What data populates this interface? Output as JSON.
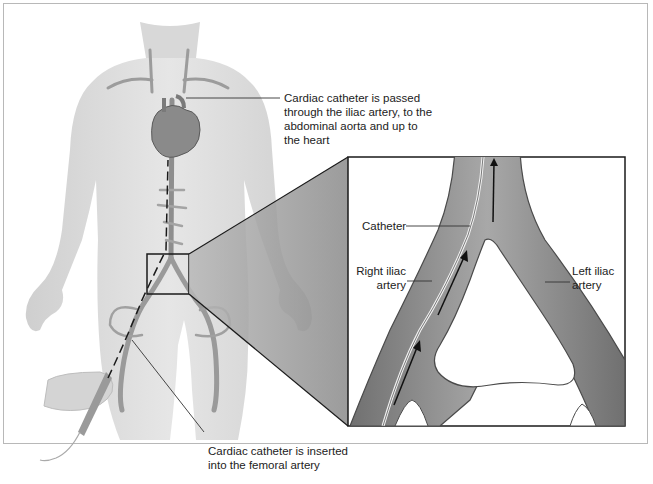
{
  "figure": {
    "callouts": {
      "heart": "Cardiac catheter is passed through the iliac artery, to the abdominal aorta and up to the heart",
      "heart_lines": [
        "Cardiac catheter is passed",
        "through the iliac artery, to the",
        "abdominal aorta and up to",
        "the heart"
      ],
      "femoral_lines": [
        "Cardiac catheter is inserted",
        "into the femoral artery"
      ]
    },
    "inset": {
      "catheter": "Catheter",
      "right_iliac_lines": [
        "Right iliac",
        "artery"
      ],
      "left_iliac_lines": [
        "Left iliac",
        "artery"
      ]
    },
    "colors": {
      "skin": "#dcdcdc",
      "skin_shadow": "#c4c4c4",
      "artery": "#a9a9a9",
      "artery_dark": "#6e6e6e",
      "inset_wedge": "#9a9a9a",
      "line": "#222222"
    }
  }
}
